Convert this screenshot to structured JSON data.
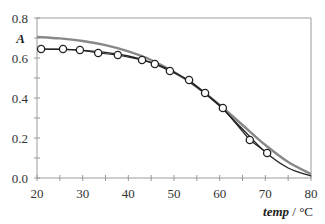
{
  "chart_data": {
    "type": "scatter",
    "title": "",
    "xlabel": "temp",
    "xlabel_unit": "°C",
    "xlabel_separator": "/",
    "ylabel": "A",
    "xlim": [
      20,
      80
    ],
    "ylim": [
      0.0,
      0.8
    ],
    "x_ticks": [
      20,
      30,
      40,
      50,
      60,
      70,
      80
    ],
    "x_tick_labels": [
      "20",
      "30",
      "40",
      "50",
      "60",
      "70",
      "80"
    ],
    "x_minor_ticks": [
      25,
      35,
      45,
      55,
      65,
      75
    ],
    "y_ticks": [
      0.0,
      0.2,
      0.4,
      0.6,
      0.8
    ],
    "y_tick_labels": [
      "0.0",
      "0.2",
      "0.4",
      "0.6",
      "0.8"
    ],
    "y_minor_ticks": [
      0.1,
      0.3,
      0.5,
      0.7
    ],
    "grid": false,
    "legend": null,
    "series": [
      {
        "name": "measured",
        "style": "open-circle markers with black connecting line",
        "color": "#222222",
        "x": [
          20.9,
          25.7,
          29.4,
          33.4,
          37.7,
          43.0,
          45.8,
          49.1,
          53.3,
          56.8,
          60.7,
          66.6,
          70.4
        ],
        "y": [
          0.645,
          0.645,
          0.64,
          0.625,
          0.615,
          0.59,
          0.57,
          0.535,
          0.49,
          0.425,
          0.35,
          0.19,
          0.125
        ]
      },
      {
        "name": "fit-black",
        "style": "line",
        "color": "#222222",
        "x": [
          20,
          25,
          30,
          35,
          40,
          45,
          50,
          55,
          60,
          65,
          70,
          75,
          80
        ],
        "y": [
          0.645,
          0.643,
          0.638,
          0.628,
          0.61,
          0.578,
          0.53,
          0.455,
          0.36,
          0.245,
          0.13,
          0.05,
          0.01
        ]
      },
      {
        "name": "fit-gray",
        "style": "line",
        "color": "#888888",
        "x": [
          20,
          25,
          30,
          35,
          40,
          45,
          50,
          55,
          60,
          65,
          70,
          75,
          80
        ],
        "y": [
          0.705,
          0.698,
          0.685,
          0.664,
          0.633,
          0.59,
          0.53,
          0.455,
          0.365,
          0.265,
          0.165,
          0.08,
          0.02
        ]
      }
    ]
  }
}
